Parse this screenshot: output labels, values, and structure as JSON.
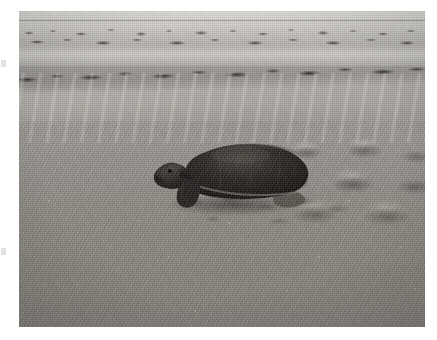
{
  "page": {
    "background_color": "#ffffff",
    "width": 437,
    "height": 340
  },
  "photo": {
    "caption": "A green sea turtle crawling across a sandy beach, leaving flipper tracks behind it, with the surf line and a dark band of tidal wrack debris visible in the distance.",
    "subject": "sea-turtle",
    "scene": "beach",
    "orientation": "landscape",
    "color_mode": "black-and-white",
    "frame": {
      "left": 19,
      "top": 11,
      "width": 406,
      "height": 316
    },
    "regions": [
      {
        "name": "distant-surf-sheen",
        "description": "Bright wet sand and surf sheen across the top of the frame"
      },
      {
        "name": "far-wrack-line",
        "description": "Scattered dark seaweed and debris clumps along the distant high-tide line"
      },
      {
        "name": "main-wrack-band",
        "description": "Heavy dark band of tidal wrack crossing the upper third of the frame"
      },
      {
        "name": "berm-sheen",
        "description": "Broad light sand berm sweeping below the wrack band"
      },
      {
        "name": "flipper-track-field",
        "description": "Churned crescent-shaped flipper track pits on the right side"
      },
      {
        "name": "foreground-sand",
        "description": "Coarse grainy dry sand filling the lower half of the frame"
      }
    ],
    "palette": {
      "sky_sand_light": "#cfcdc8",
      "mid_sand": "#a09d98",
      "foreground_sand": "#8b8881",
      "wrack_dark": "#2e2c29",
      "turtle_shell_dark": "#1d1b19",
      "turtle_shell_mid": "#35322e",
      "turtle_highlight": "#6a6660",
      "shadow": "#3a3834",
      "paper_white": "#ffffff"
    }
  },
  "turtle": {
    "species_common_name": "sea turtle",
    "facing": "left",
    "parts": [
      {
        "name": "carapace",
        "label": "Carapace (shell)"
      },
      {
        "name": "head",
        "label": "Head"
      },
      {
        "name": "front-flipper",
        "label": "Front flipper"
      },
      {
        "name": "rear-flipper",
        "label": "Rear flipper"
      },
      {
        "name": "cast-shadow",
        "label": "Shadow on sand"
      }
    ]
  },
  "artifacts": {
    "left_edge_marks": [
      {
        "name": "scan-mark-upper",
        "top": 60
      },
      {
        "name": "scan-mark-lower",
        "top": 248
      }
    ]
  }
}
